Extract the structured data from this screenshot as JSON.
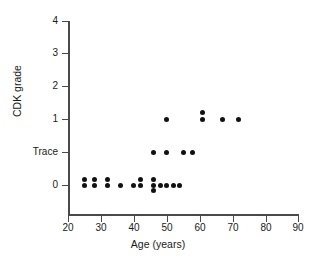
{
  "chart_data": {
    "type": "scatter",
    "title": "",
    "xlabel": "Age (years)",
    "ylabel": "CDK grade",
    "xlim": [
      20,
      90
    ],
    "ylim": [
      0,
      4
    ],
    "grid": false,
    "legend": null,
    "x_ticks": [
      20,
      30,
      40,
      50,
      60,
      70,
      80,
      90
    ],
    "x_tick_labels": [
      "20",
      "30",
      "40",
      "50",
      "60",
      "70",
      "80",
      "90"
    ],
    "y_ticks": [
      0,
      0.5,
      1,
      2,
      3,
      4
    ],
    "y_tick_labels": [
      "0",
      "Trace",
      "1",
      "2",
      "3",
      "4"
    ],
    "marker": "filled-circle",
    "marker_color": "#111111",
    "axis_color": "#4a4a4a",
    "points": [
      {
        "age": 25,
        "grade": "0",
        "y": 0.08
      },
      {
        "age": 25,
        "grade": "0",
        "y": 0.0
      },
      {
        "age": 28,
        "grade": "0",
        "y": 0.08
      },
      {
        "age": 28,
        "grade": "0",
        "y": 0.0
      },
      {
        "age": 32,
        "grade": "0",
        "y": 0.08
      },
      {
        "age": 32,
        "grade": "0",
        "y": 0.0
      },
      {
        "age": 36,
        "grade": "0",
        "y": 0.0
      },
      {
        "age": 40,
        "grade": "0",
        "y": 0.0
      },
      {
        "age": 42,
        "grade": "0",
        "y": 0.08
      },
      {
        "age": 42,
        "grade": "0",
        "y": 0.0
      },
      {
        "age": 46,
        "grade": "0",
        "y": 0.08
      },
      {
        "age": 46,
        "grade": "0",
        "y": 0.0
      },
      {
        "age": 46,
        "grade": "0",
        "y": -0.08
      },
      {
        "age": 48,
        "grade": "0",
        "y": 0.0
      },
      {
        "age": 50,
        "grade": "0",
        "y": 0.0
      },
      {
        "age": 52,
        "grade": "0",
        "y": 0.0
      },
      {
        "age": 54,
        "grade": "0",
        "y": 0.0
      },
      {
        "age": 46,
        "grade": "Trace",
        "y": 0.5
      },
      {
        "age": 50,
        "grade": "Trace",
        "y": 0.5
      },
      {
        "age": 55,
        "grade": "Trace",
        "y": 0.5
      },
      {
        "age": 58,
        "grade": "Trace",
        "y": 0.5
      },
      {
        "age": 50,
        "grade": "1",
        "y": 1.0
      },
      {
        "age": 61,
        "grade": "1",
        "y": 1.1
      },
      {
        "age": 61,
        "grade": "1",
        "y": 1.0
      },
      {
        "age": 67,
        "grade": "1",
        "y": 1.0
      },
      {
        "age": 72,
        "grade": "1",
        "y": 1.0
      }
    ]
  },
  "axes": {
    "x_title": "Age (years)",
    "y_title": "CDK grade"
  }
}
